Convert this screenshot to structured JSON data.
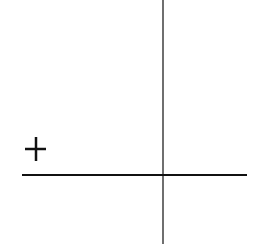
{
  "diagram": {
    "type": "sign-chart",
    "symbols": [
      {
        "name": "plus",
        "glyph": "+",
        "region": "upper-left quadrant"
      }
    ],
    "axes": {
      "horizontal": {
        "color": "#111111"
      },
      "vertical": {
        "color": "#6f6f6f"
      }
    }
  }
}
